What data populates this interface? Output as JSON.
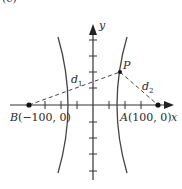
{
  "figure": {
    "panel_label": "(c)",
    "axes": {
      "x_label": "x",
      "y_label": "y"
    },
    "points": {
      "B": {
        "name": "B",
        "coords": "(−100, 0)"
      },
      "A": {
        "name": "A",
        "coords": "(100, 0)"
      },
      "P": {
        "name": "P"
      }
    },
    "distances": {
      "d1": "d",
      "d1_sub": "1",
      "d2": "d",
      "d2_sub": "2"
    },
    "colors": {
      "line": "#333333",
      "background": "#ffffff"
    }
  }
}
